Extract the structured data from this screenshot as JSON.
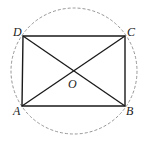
{
  "figure": {
    "colors": {
      "line": "#1a1a1a",
      "circle": "#888888",
      "background": "#ffffff"
    },
    "points": {
      "A": {
        "label": "A",
        "x": 22,
        "y": 106
      },
      "B": {
        "label": "B",
        "x": 125,
        "y": 106
      },
      "C": {
        "label": "C",
        "x": 125,
        "y": 36
      },
      "D": {
        "label": "D",
        "x": 23,
        "y": 36
      },
      "O": {
        "label": "O",
        "x": 74,
        "y": 71
      }
    },
    "circle": {
      "cx": 74,
      "cy": 71,
      "r": 63,
      "style": "dashed"
    },
    "segments": [
      "AB",
      "BC",
      "CD",
      "DA",
      "AC",
      "BD"
    ]
  }
}
